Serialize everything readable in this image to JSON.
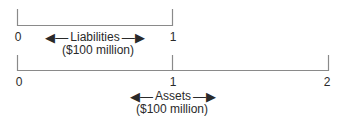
{
  "diagram": {
    "colors": {
      "line": "#8a8a8a",
      "text": "#2a2a2a"
    },
    "liabilities": {
      "ticks": [
        "0",
        "1"
      ],
      "label": "Liabilities",
      "units": "($100 million)",
      "left_arrow": "◀—",
      "right_arrow": "—▶"
    },
    "assets": {
      "ticks": [
        "0",
        "1",
        "2"
      ],
      "label": "Assets",
      "units": "($100 million)",
      "left_arrow": "◀—",
      "right_arrow": "—▶"
    }
  }
}
